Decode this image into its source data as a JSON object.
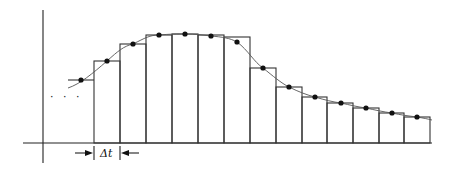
{
  "diagram": {
    "axes": {
      "x_axis_y": 143,
      "x_axis_x_range": [
        23,
        432
      ],
      "y_axis_x": 43,
      "y_axis_y_range": [
        10,
        163
      ]
    },
    "continuation_marker": "· · ·",
    "interval_label": "Δt",
    "interval_marker": {
      "left_edge_x": 94,
      "right_edge_x": 120,
      "arrow_y": 153
    },
    "lead_step": {
      "x0": 68,
      "x1": 94,
      "top": 80
    },
    "bars": [
      {
        "x0": 94,
        "x1": 120,
        "top": 61
      },
      {
        "x0": 120,
        "x1": 146,
        "top": 44
      },
      {
        "x0": 146,
        "x1": 172,
        "top": 35
      },
      {
        "x0": 172,
        "x1": 198,
        "top": 34
      },
      {
        "x0": 198,
        "x1": 224,
        "top": 35
      },
      {
        "x0": 224,
        "x1": 250,
        "top": 37
      },
      {
        "x0": 250,
        "x1": 276,
        "top": 68
      },
      {
        "x0": 276,
        "x1": 302,
        "top": 87
      },
      {
        "x0": 302,
        "x1": 327,
        "top": 97
      },
      {
        "x0": 327,
        "x1": 353,
        "top": 103
      },
      {
        "x0": 353,
        "x1": 379,
        "top": 108
      },
      {
        "x0": 379,
        "x1": 404,
        "top": 113
      },
      {
        "x0": 404,
        "x1": 430,
        "top": 117
      }
    ],
    "sample_points": [
      [
        81,
        80
      ],
      [
        107,
        61
      ],
      [
        133,
        44
      ],
      [
        159,
        35
      ],
      [
        185,
        34
      ],
      [
        211,
        36
      ],
      [
        237,
        42
      ],
      [
        263,
        68
      ],
      [
        289,
        87
      ],
      [
        315,
        97
      ],
      [
        341,
        103
      ],
      [
        366,
        108
      ],
      [
        392,
        113
      ],
      [
        417,
        117
      ]
    ],
    "curve_path": "M68,88 C80,84 92,74 107,61 C118,51 124,46 133,44 C145,38 150,35 159,35 C170,34 178,34 185,34 C195,34 203,35 211,36 C222,37 230,38 237,42 C248,50 254,62 263,68 C273,76 281,83 289,87 C299,92 307,95 315,97 C325,100 333,102 341,103 C350,105 358,107 366,108 C375,110 384,112 392,113 C401,115 409,116 417,117 C423,118 428,119 432,120"
  }
}
